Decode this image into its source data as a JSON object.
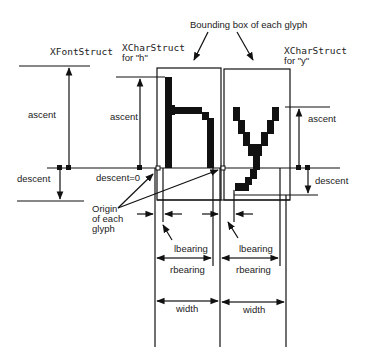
{
  "diagram": {
    "title_label": "Bounding box of each glyph",
    "font_struct_label": "XFontStruct",
    "char_struct_h": {
      "line1": "XCharStruct",
      "line2": "for \"h\""
    },
    "char_struct_y": {
      "line1": "XCharStruct",
      "line2": "for \"y\""
    },
    "labels": {
      "ascent_font": "ascent",
      "descent_font": "descent",
      "ascent_h": "ascent",
      "descent_h": "descent=0",
      "ascent_y": "ascent",
      "descent_y": "descent",
      "origin_line1": "Origin",
      "origin_line2": "of each",
      "origin_line3": "glyph",
      "lbearing_h": "lbearing",
      "rbearing_h": "rbearing",
      "width_h": "width",
      "lbearing_y": "lbearing",
      "rbearing_y": "rbearing",
      "width_y": "width"
    },
    "glyphs": [
      "h",
      "y"
    ],
    "colors": {
      "ink": "#111111",
      "background": "#ffffff"
    }
  }
}
